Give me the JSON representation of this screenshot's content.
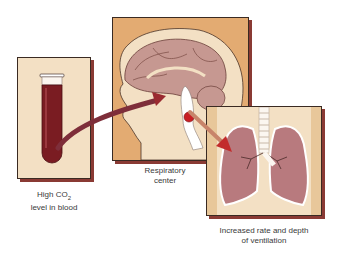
{
  "diagram": {
    "type": "flow",
    "colors": {
      "panel_bg_light": "#f3e0c4",
      "panel_bg_tan": "#e3ab72",
      "panel_border": "#3a2a22",
      "panel_shadow": "#8a3a34",
      "blood": "#7a1c22",
      "arrow": "#7e2e3a",
      "arrow_head": "#c22c2c",
      "brain": "#c69891",
      "lung": "#b87a7e",
      "center_dot": "#c81e24"
    },
    "nodes": [
      {
        "id": "blood",
        "icon": "test-tube-blood-icon",
        "caption_line1_prefix": "High CO",
        "caption_subscript": "2",
        "caption_line2": "level in blood"
      },
      {
        "id": "brain",
        "icon": "head-brain-icon",
        "caption_line1": "Respiratory",
        "caption_line2": "center"
      },
      {
        "id": "lungs",
        "icon": "lungs-icon",
        "caption_line1": "Increased rate and depth",
        "caption_line2": "of ventilation"
      }
    ],
    "edges": [
      {
        "from": "blood",
        "to": "brain"
      },
      {
        "from": "brain",
        "to": "lungs"
      }
    ]
  }
}
